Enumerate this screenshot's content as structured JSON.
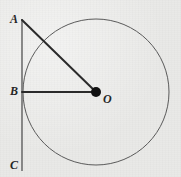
{
  "figure": {
    "background_color": "#e9e9e7",
    "stroke_color_circle": "#5a5a5a",
    "stroke_color_segment": "#2b2b2b",
    "stroke_color_vertical": "#6f6f6f",
    "point_fill_color": "#111111"
  },
  "labels": {
    "a": "A",
    "b": "B",
    "c": "C",
    "o": "O"
  },
  "geometry": {
    "circle": {
      "center_x": 96,
      "center_y": 92,
      "radius": 73,
      "stroke_width": 1
    },
    "center_point": {
      "x": 96,
      "y": 92,
      "radius": 5
    },
    "vertical_line": {
      "x": 22,
      "y_top": 19,
      "y_bottom": 171,
      "stroke_width": 1.6
    },
    "segment_ao": {
      "x1": 22,
      "y1": 20,
      "x2": 96,
      "y2": 92,
      "stroke_width": 2
    },
    "segment_bo": {
      "x1": 22,
      "y1": 92,
      "x2": 96,
      "y2": 92,
      "stroke_width": 2
    },
    "label_positions": {
      "a": {
        "left": 10,
        "top": 13
      },
      "b": {
        "left": 10,
        "top": 85
      },
      "c": {
        "left": 10,
        "top": 159
      },
      "o": {
        "left": 103,
        "top": 93
      }
    }
  }
}
